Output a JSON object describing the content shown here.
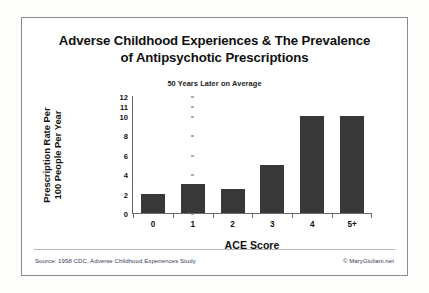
{
  "card": {
    "title_line_1": "Adverse Childhood Experiences & The Prevalence",
    "title_line_2": "of Antipsychotic Prescriptions",
    "subtitle": "50 Years Later on Average"
  },
  "footer": {
    "source": "Source: 1998 CDC, Adverse Childhood Experiences Study",
    "credit": "© MaryGiuliani.net"
  },
  "colors": {
    "bar": "#383838",
    "axis": "#6a6a6a",
    "border": "#8b8b8b",
    "footer_text": "#3b3b5c",
    "background": "#ffffff"
  },
  "chart_data": {
    "type": "bar",
    "title": "Adverse Childhood Experiences & The Prevalence of Antipsychotic Prescriptions",
    "subtitle": "50 Years Later on Average",
    "xlabel": "ACE Score",
    "ylabel": "Prescription Rate Per\n100 People Per Year",
    "categories": [
      "0",
      "1",
      "2",
      "3",
      "4",
      "5+"
    ],
    "values": [
      2,
      3,
      2.5,
      5,
      10,
      10
    ],
    "ytick_labels": [
      "0",
      "2",
      "4",
      "6",
      "8",
      "10",
      "11",
      "12"
    ],
    "ytick_values": [
      0,
      2,
      4,
      6,
      8,
      10,
      11,
      12
    ],
    "ytick_positions_pct": [
      0,
      16.5,
      33,
      49.5,
      66,
      82.5,
      91,
      99
    ],
    "ylim": [
      0,
      12
    ],
    "grid": false,
    "legend": null,
    "note": "Y axis spacing is non-linear above 10: ticks 10, 11 and 12 are compressed."
  }
}
